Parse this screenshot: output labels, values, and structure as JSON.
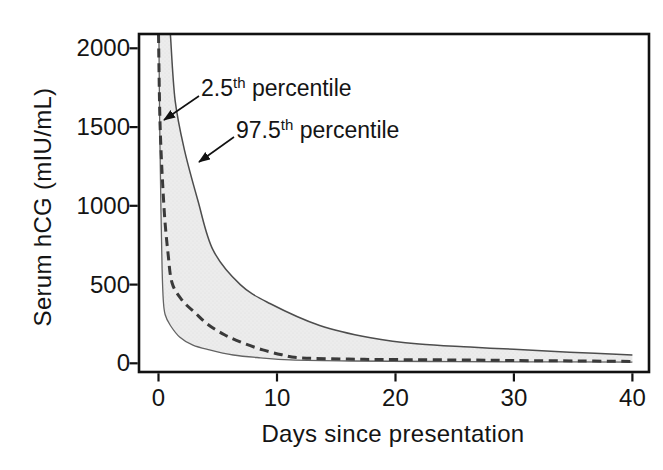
{
  "figure": {
    "y_axis_title": "Serum hCG (mIU/mL)",
    "x_axis_title": "Days since presentation",
    "annotations": [
      {
        "base": "2.5",
        "sup": "th",
        "rest": " percentile"
      },
      {
        "base": "97.5",
        "sup": "th",
        "rest": " percentile"
      }
    ]
  },
  "colors": {
    "background": "#ffffff",
    "frame": "#111111",
    "band_fill": "#ececec",
    "band_dots": "#dcdcdc",
    "upper_curve": "#4d4d4d",
    "lower_curve": "#636363",
    "dashed_curve": "#3a3a3a",
    "arrow": "#111111",
    "text": "#141414"
  },
  "chart_data": {
    "type": "area",
    "title": "",
    "xlabel": "Days since presentation",
    "ylabel": "Serum hCG (mIU/mL)",
    "xlim": [
      -1.65,
      41.4
    ],
    "ylim": [
      -55,
      2091
    ],
    "x_ticks": [
      0,
      10,
      20,
      30,
      40
    ],
    "x_tick_labels": [
      "0",
      "10",
      "20",
      "30",
      "40"
    ],
    "y_ticks": [
      0,
      500,
      1000,
      1500,
      2000
    ],
    "y_tick_labels": [
      "0",
      "500",
      "1000",
      "1500",
      "2000"
    ],
    "grid": false,
    "legend": "none",
    "band_between": [
      "band-lower-edge",
      "97.5th percentile"
    ],
    "series": [
      {
        "name": "2.5th percentile",
        "style": "dashed",
        "points": [
          [
            0,
            2090
          ],
          [
            0.13,
            1510
          ],
          [
            0.46,
            990
          ],
          [
            0.8,
            700
          ],
          [
            1.14,
            510
          ],
          [
            2,
            400
          ],
          [
            3.1,
            320
          ],
          [
            4.2,
            245
          ],
          [
            5.6,
            180
          ],
          [
            7.1,
            130
          ],
          [
            8.8,
            85
          ],
          [
            10.4,
            55
          ],
          [
            11.9,
            35
          ],
          [
            16,
            27
          ],
          [
            20,
            24
          ],
          [
            26,
            21
          ],
          [
            30,
            18
          ],
          [
            35.5,
            15
          ],
          [
            40,
            12
          ]
        ]
      },
      {
        "name": "97.5th percentile",
        "style": "solid",
        "points": [
          [
            1,
            2090
          ],
          [
            1.4,
            1670
          ],
          [
            2.2,
            1350
          ],
          [
            3.3,
            1040
          ],
          [
            4.6,
            720
          ],
          [
            6.9,
            500
          ],
          [
            9.4,
            380
          ],
          [
            13.6,
            240
          ],
          [
            17.9,
            162
          ],
          [
            22,
            122
          ],
          [
            26.3,
            103
          ],
          [
            30,
            89
          ],
          [
            34.7,
            71
          ],
          [
            40,
            53
          ]
        ]
      },
      {
        "name": "band-lower-edge",
        "style": "solid-thin",
        "points": [
          [
            0.03,
            2090
          ],
          [
            0.1,
            1510
          ],
          [
            0.2,
            990
          ],
          [
            0.3,
            600
          ],
          [
            0.4,
            400
          ],
          [
            0.55,
            310
          ],
          [
            1,
            240
          ],
          [
            1.8,
            165
          ],
          [
            2.9,
            115
          ],
          [
            4.3,
            85
          ],
          [
            6.3,
            53
          ],
          [
            8.6,
            35
          ],
          [
            11.1,
            22
          ],
          [
            16.2,
            15
          ],
          [
            24.6,
            11
          ],
          [
            34,
            9
          ],
          [
            40,
            8
          ]
        ]
      }
    ]
  }
}
